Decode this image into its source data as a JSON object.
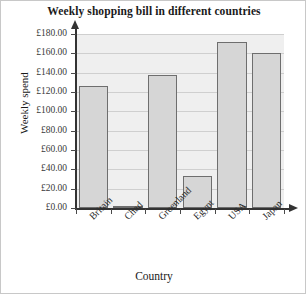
{
  "chart_data": {
    "type": "bar",
    "title": "Weekly shopping bill in different countries",
    "xlabel": "Country",
    "ylabel": "Weekly spend",
    "categories": [
      "Britain",
      "Chad",
      "Greenland",
      "Egypt",
      "USA",
      "Japan"
    ],
    "values": [
      126,
      2,
      138,
      33,
      172,
      160
    ],
    "ylim": [
      0,
      180
    ],
    "ytick_step": 20,
    "ytick_labels": [
      "£180.00",
      "£160.00",
      "£140.00",
      "£120.00",
      "£100.00",
      "£80.00",
      "£60.00",
      "£40.00",
      "£20.00",
      "£0.00"
    ],
    "ytick_values": [
      180,
      160,
      140,
      120,
      100,
      80,
      60,
      40,
      20,
      0
    ],
    "grid": true,
    "legend": false,
    "currency": "GBP",
    "bar_color": "#d6d6d6",
    "bar_border_color": "#6e6e6e",
    "plot_background": "#efefef",
    "gridline_color": "#cfcfcf",
    "axis_color": "#333333"
  }
}
